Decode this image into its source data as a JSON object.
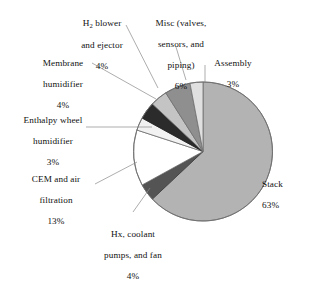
{
  "figure": {
    "background": "#ffffff",
    "text_color": "#111111",
    "leader_line_color": "#8a8a8a"
  },
  "chart_data": {
    "type": "pie",
    "title": "",
    "xlabel": "",
    "ylabel": "",
    "units": "percent",
    "total": 100,
    "start_angle_deg": 0,
    "direction": "clockwise-from-12-oclock",
    "legend": "none (direct labels with leader lines)",
    "grid": false,
    "categories": [
      "Stack",
      "Hx, coolant pumps, and fan",
      "CEM and air filtration",
      "Enthalpy wheel humidifier",
      "Membrane humidifier",
      "H2 blower and ejector",
      "Misc (valves, sensors, and piping)",
      "Assembly"
    ],
    "values": [
      63,
      4,
      13,
      3,
      4,
      4,
      6,
      3
    ],
    "slices": [
      {
        "key": "stack",
        "label": "Stack",
        "label_line2": "",
        "value": 63,
        "pct_text": "63%",
        "color": "#b3b3b3"
      },
      {
        "key": "hx",
        "label": "Hx, coolant",
        "label_line2": "pumps, and fan",
        "value": 4,
        "pct_text": "4%",
        "color": "#545454"
      },
      {
        "key": "cem",
        "label": "CEM and air",
        "label_line2": "filtration",
        "value": 13,
        "pct_text": "13%",
        "color": "#ffffff"
      },
      {
        "key": "enthalpy",
        "label": "Enthalpy wheel",
        "label_line2": "humidifier",
        "value": 3,
        "pct_text": "3%",
        "color": "#f2f2f2"
      },
      {
        "key": "membrane",
        "label": "Membrane",
        "label_line2": "humidifier",
        "value": 4,
        "pct_text": "4%",
        "color": "#2b2b2b"
      },
      {
        "key": "h2",
        "label": "H2 blower",
        "label_line2": "and ejector",
        "value": 4,
        "pct_text": "4%",
        "color": "#c4c4c4"
      },
      {
        "key": "misc",
        "label": "Misc (valves,",
        "label_line2": "sensors, and piping)",
        "value": 6,
        "pct_text": "6%",
        "color": "#8f8f8f"
      },
      {
        "key": "assembly",
        "label": "Assembly",
        "label_line2": "",
        "value": 3,
        "pct_text": "3%",
        "color": "#e0e0e0"
      }
    ]
  },
  "labels": {
    "h2": {
      "line1": "H",
      "sub": "2",
      "line1b": " blower",
      "line2": "and ejector",
      "pct": "4%"
    },
    "misc": {
      "line1": "Misc (valves,",
      "line2": "sensors, and",
      "line3": "piping)",
      "pct": "6%"
    },
    "assembly": {
      "line1": "Assembly",
      "pct": "3%"
    },
    "membrane": {
      "line1": "Membrane",
      "line2": "humidifier",
      "pct": "4%"
    },
    "enthalpy": {
      "line1": "Enthalpy wheel",
      "line2": "humidifier",
      "pct": "3%"
    },
    "cem": {
      "line1": "CEM and air",
      "line2": "filtration",
      "pct": "13%"
    },
    "hx": {
      "line1": "Hx, coolant",
      "line2": "pumps, and fan",
      "pct": "4%"
    },
    "stack": {
      "line1": "Stack",
      "pct": "63%"
    }
  }
}
